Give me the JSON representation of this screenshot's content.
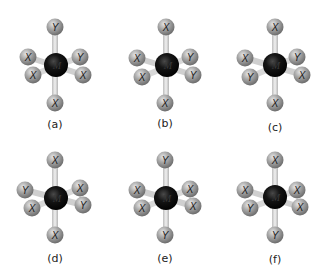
{
  "figure": {
    "type": "octahedral MX4Y2 / MX3Y3 molecular models",
    "central_atom_label": "M",
    "colors": {
      "central_atom": "#111111",
      "ligand_atom": "#9a9a9a",
      "bond": "#d2d2d2",
      "label_text": "#1a1a1a"
    },
    "panels": [
      {
        "caption": "(a)",
        "top": "Y",
        "left_upper": "X",
        "left_lower": "X",
        "right_upper": "Y",
        "right_lower": "X",
        "bottom": "X"
      },
      {
        "caption": "(b)",
        "top": "X",
        "left_upper": "X",
        "left_lower": "X",
        "right_upper": "Y",
        "right_lower": "Y",
        "bottom": "X"
      },
      {
        "caption": "(c)",
        "top": "X",
        "left_upper": "X",
        "left_lower": "Y",
        "right_upper": "Y",
        "right_lower": "X",
        "bottom": "X"
      },
      {
        "caption": "(d)",
        "top": "X",
        "left_upper": "Y",
        "left_lower": "X",
        "right_upper": "X",
        "right_lower": "Y",
        "bottom": "X"
      },
      {
        "caption": "(e)",
        "top": "Y",
        "left_upper": "X",
        "left_lower": "X",
        "right_upper": "X",
        "right_lower": "X",
        "bottom": "Y"
      },
      {
        "caption": "(f)",
        "top": "X",
        "left_upper": "X",
        "left_lower": "Y",
        "right_upper": "X",
        "right_lower": "X",
        "bottom": "Y"
      }
    ]
  }
}
